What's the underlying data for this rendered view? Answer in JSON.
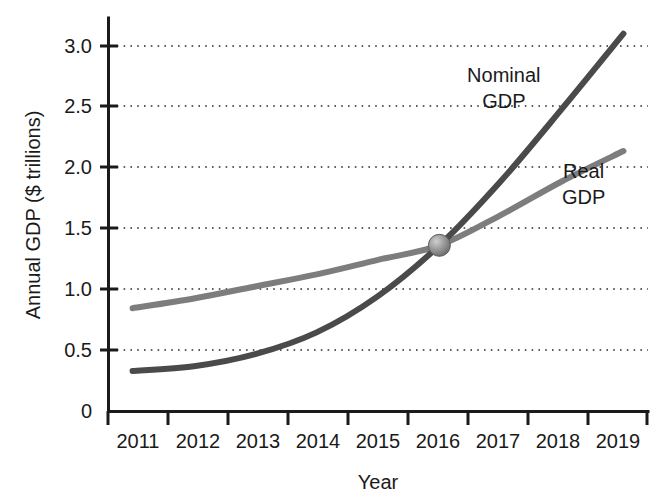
{
  "chart_data": {
    "type": "line",
    "title": "",
    "xlabel": "Year",
    "ylabel": "Annual GDP ($ trillions)",
    "categories": [
      "2011",
      "2012",
      "2013",
      "2014",
      "2015",
      "2016",
      "2017",
      "2018",
      "2019"
    ],
    "x": [
      2011,
      2012,
      2013,
      2014,
      2015,
      2016,
      2017,
      2018,
      2019
    ],
    "xlim": [
      2010.6,
      2019.4
    ],
    "ylim": [
      0,
      3.25
    ],
    "yticks": [
      0,
      0.5,
      1.0,
      1.5,
      2.0,
      2.5,
      3.0
    ],
    "ytick_labels": [
      "0",
      "0.5",
      "1.0",
      "1.5",
      "2.0",
      "2.5",
      "3.0"
    ],
    "grid": "horizontal-dotted",
    "legend": "inline-annotations",
    "series": [
      {
        "name": "Nominal GDP",
        "color": "#4a4a4a",
        "values": [
          0.33,
          0.37,
          0.47,
          0.65,
          0.95,
          1.37,
          1.9,
          2.5,
          3.12
        ]
      },
      {
        "name": "Real GDP",
        "color": "#7d7d7d",
        "values": [
          0.85,
          0.93,
          1.03,
          1.13,
          1.25,
          1.37,
          1.62,
          1.9,
          2.15
        ]
      }
    ],
    "annotations": [
      {
        "label_line1": "Nominal",
        "label_line2": "GDP",
        "x": 2017.05,
        "y": 2.72
      },
      {
        "label_line1": "Real",
        "label_line2": "GDP",
        "x": 2018.35,
        "y": 1.93
      }
    ],
    "markers": [
      {
        "name": "intersection-point",
        "x": 2016,
        "y": 1.37,
        "color": "#8c8c8c",
        "edge_color": "#5a5a5a"
      }
    ]
  },
  "axis": {
    "y_title": "Annual GDP ($ trillions)",
    "x_title": "Year",
    "y_labels": [
      "3.0",
      "2.5",
      "2.0",
      "1.5",
      "1.0",
      "0.5",
      "0"
    ],
    "x_labels": [
      "2011",
      "2012",
      "2013",
      "2014",
      "2015",
      "2016",
      "2017",
      "2018",
      "2019"
    ]
  },
  "annotations": {
    "nominal_line1": "Nominal",
    "nominal_line2": "GDP",
    "real_line1": "Real",
    "real_line2": "GDP"
  },
  "colors": {
    "nominal": "#4a4a4a",
    "real": "#7d7d7d",
    "axis": "#1a1a1a",
    "grid": "#2b2b2b",
    "marker_fill": "#8c8c8c",
    "background": "#ffffff"
  }
}
